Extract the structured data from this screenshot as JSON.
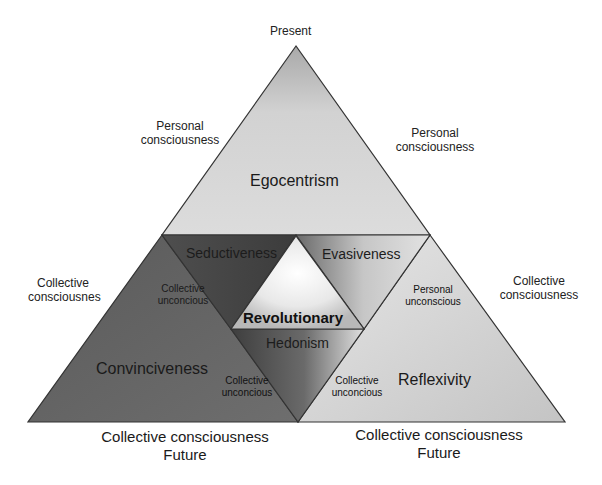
{
  "diagram": {
    "type": "nested-triangle-diagram",
    "top_label": "Present",
    "side_labels": {
      "upper_left": "Personal consciousness",
      "upper_right": "Personal consciousness",
      "mid_left": "Collective consciousnes",
      "mid_right": "Collective consciousness"
    },
    "bottom_labels": {
      "left": {
        "line1": "Collective consciousness",
        "line2": "Future"
      },
      "right": {
        "line1": "Collective consciousness",
        "line2": "Future"
      }
    },
    "regions": {
      "top": "Egocentrism",
      "left": "Convinciveness",
      "right": "Reflexivity",
      "center": "Revolutionary",
      "upper_left_inner": "Seductiveness",
      "upper_right_inner": "Evasiveness",
      "lower_inner": "Hedonism"
    },
    "inner_edge_labels": {
      "upper_left": "Collective unconcious",
      "upper_right": "Personal unconscious",
      "lower_left": "Collective unconcious",
      "lower_right": "Collective unconcious"
    },
    "colors": {
      "top_fill": "#d4d4d4",
      "left_fill": "#6a6a6a",
      "right_fill": "#d6d6d6",
      "center_fill": "#f2f2f2",
      "outline": "#333333"
    }
  }
}
